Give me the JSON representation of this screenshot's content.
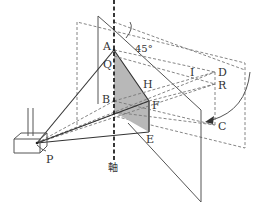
{
  "figure": {
    "type": "geometry-diagram"
  },
  "labels": {
    "A": "A",
    "Q": "Q",
    "B": "B",
    "H": "H",
    "F": "F",
    "E": "E",
    "I": "I",
    "D": "D",
    "R": "R",
    "C": "C",
    "P": "P",
    "axis": "軸",
    "angle": "45°"
  },
  "colors": {
    "line": "#555555",
    "dashed": "#777777",
    "shade": "#b8b8b8",
    "axis": "#222222",
    "background": "#ffffff"
  }
}
